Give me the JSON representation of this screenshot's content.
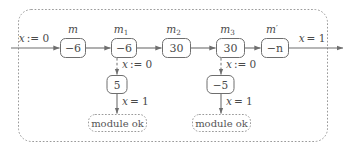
{
  "diagram": {
    "outer_border_style": "dotted",
    "stroke_color": "#6e6e6e",
    "text_color": "#4a4a4a",
    "background": "#ffffff",
    "entry_label": "x := 0",
    "exit_label": "x = 1",
    "main_chain": [
      {
        "name": "m-box",
        "top_label": "m",
        "top_sub": "",
        "top_prime": "",
        "value": "−6"
      },
      {
        "name": "m1-box",
        "top_label": "m",
        "top_sub": "1",
        "top_prime": "",
        "value": "−6"
      },
      {
        "name": "m2-box",
        "top_label": "m",
        "top_sub": "2",
        "top_prime": "",
        "value": "30"
      },
      {
        "name": "m3-box",
        "top_label": "m",
        "top_sub": "3",
        "top_prime": "",
        "value": "30"
      },
      {
        "name": "mprime-box",
        "top_label": "m",
        "top_sub": "",
        "top_prime": "′",
        "value": "−n"
      }
    ],
    "branches": [
      {
        "name": "branch-left",
        "source": "m1-box",
        "guard_label": "x := 0",
        "node_value": "5",
        "result_label": "x = 1",
        "terminal_label": "module ok"
      },
      {
        "name": "branch-right",
        "source": "m3-box",
        "guard_label": "x := 0",
        "node_value": "−5",
        "result_label": "x = 1",
        "terminal_label": "module ok"
      }
    ]
  }
}
